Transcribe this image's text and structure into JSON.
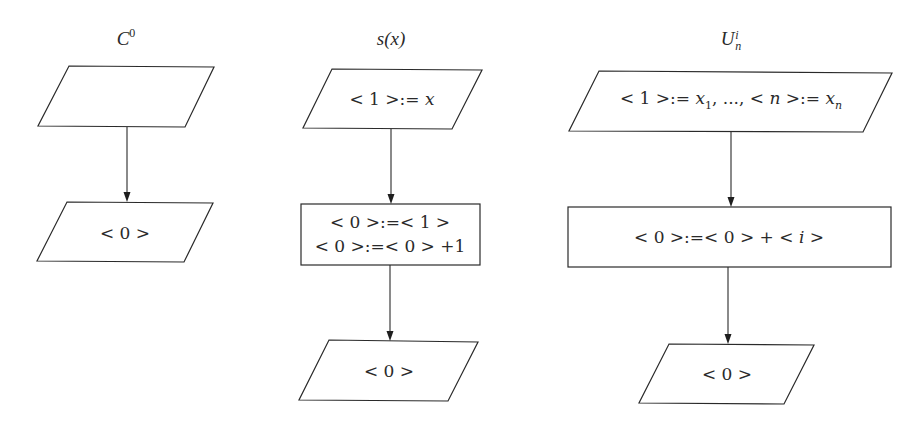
{
  "diagram": {
    "background": "#ffffff",
    "line_color": "#2a2a2a",
    "flowcharts": [
      {
        "id": "c0",
        "title": {
          "base": "C",
          "sup": "0",
          "x": 126,
          "y": 38
        },
        "nodes": [
          {
            "id": "c0-input",
            "type": "parallelogram",
            "points": [
              [
                69,
                66
              ],
              [
                214,
                67
              ],
              [
                185,
                127
              ],
              [
                38,
                126
              ]
            ],
            "text": "",
            "cx": 126,
            "cy": 96
          },
          {
            "id": "c0-output",
            "type": "parallelogram",
            "points": [
              [
                67,
                202
              ],
              [
                213,
                203
              ],
              [
                184,
                262
              ],
              [
                37,
                261
              ]
            ],
            "text": "< 0 >",
            "cx": 125,
            "cy": 233
          }
        ],
        "edges": [
          {
            "from": "c0-input",
            "to": "c0-output",
            "x": 127,
            "y1": 127,
            "y2": 202
          }
        ]
      },
      {
        "id": "s",
        "title": {
          "text": "s(x)",
          "x": 391,
          "y": 39
        },
        "nodes": [
          {
            "id": "s-input",
            "type": "parallelogram",
            "points": [
              [
                332,
                69
              ],
              [
                482,
                70
              ],
              [
                452,
                129
              ],
              [
                303,
                128
              ]
            ],
            "text": "< 1 >:= x",
            "cx": 392,
            "cy": 99
          },
          {
            "id": "s-process",
            "type": "rectangle",
            "x": 301,
            "y": 204,
            "w": 179,
            "h": 61,
            "lines": [
              "< 0 >:=< 1 >",
              "< 0 >:=< 0 > +1"
            ],
            "cx": 390,
            "cy": 234
          },
          {
            "id": "s-output",
            "type": "parallelogram",
            "points": [
              [
                329,
                340
              ],
              [
                478,
                342
              ],
              [
                448,
                401
              ],
              [
                299,
                400
              ]
            ],
            "text": "< 0 >",
            "cx": 389,
            "cy": 371
          }
        ],
        "edges": [
          {
            "from": "s-input",
            "to": "s-process",
            "x": 391,
            "y1": 129,
            "y2": 204
          },
          {
            "from": "s-process",
            "to": "s-output",
            "x": 390,
            "y1": 265,
            "y2": 341
          }
        ]
      },
      {
        "id": "u",
        "title": {
          "base": "U",
          "sup": "i",
          "sub": "n",
          "x": 731,
          "y": 40
        },
        "nodes": [
          {
            "id": "u-input",
            "type": "parallelogram",
            "points": [
              [
                599,
                71
              ],
              [
                892,
                73
              ],
              [
                863,
                132
              ],
              [
                569,
                131
              ]
            ],
            "text": "< 1 >:= x1, ..., < n >:= xn",
            "cx": 731,
            "cy": 102
          },
          {
            "id": "u-process",
            "type": "rectangle",
            "x": 568,
            "y": 207,
            "w": 323,
            "h": 60,
            "text": "< 0 >:=< 0 > + < i >",
            "cx": 729,
            "cy": 237
          },
          {
            "id": "u-output",
            "type": "parallelogram",
            "points": [
              [
                669,
                344
              ],
              [
                814,
                345
              ],
              [
                784,
                404
              ],
              [
                639,
                403
              ]
            ],
            "text": "< 0 >",
            "cx": 727,
            "cy": 374
          }
        ],
        "edges": [
          {
            "from": "u-input",
            "to": "u-process",
            "x": 731,
            "y1": 132,
            "y2": 207
          },
          {
            "from": "u-process",
            "to": "u-output",
            "x": 728,
            "y1": 267,
            "y2": 344
          }
        ]
      }
    ]
  },
  "labels": {
    "c0_title_base": "C",
    "c0_title_sup": "0",
    "c0_output": "< 0 >",
    "s_title": "s(x)",
    "s_input_pre": "< 1 >:= ",
    "s_input_var": "x",
    "s_process_line1": "< 0 >:=< 1 >",
    "s_process_line2": "< 0 >:=< 0 > +1",
    "s_output": "< 0 >",
    "u_title_base": "U",
    "u_title_sup": "i",
    "u_title_sub": "n",
    "u_input_a": "< 1 >:= ",
    "u_input_x1": "x",
    "u_input_sub1": "1",
    "u_input_mid": ", ..., < ",
    "u_input_n": "n",
    "u_input_b": " >:= ",
    "u_input_xn": "x",
    "u_input_subn": "n",
    "u_process_pre": "< 0 >:=< 0 > + < ",
    "u_process_i": "i",
    "u_process_post": " >",
    "u_output": "< 0 >"
  }
}
